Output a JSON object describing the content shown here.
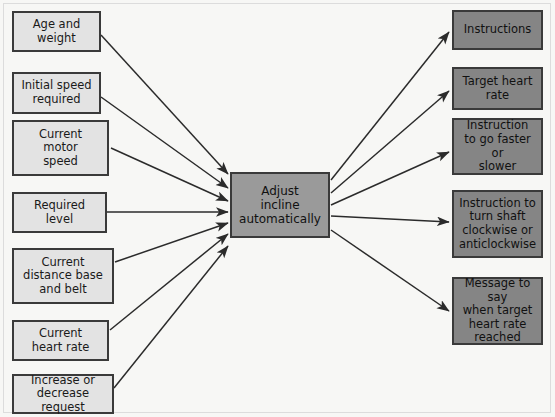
{
  "diagram": {
    "background_color": "#f7f7f5",
    "input_fill": "#e3e3e3",
    "output_fill": "#858585",
    "process_fill": "#9a9a9a",
    "border_color": "#3a3a3a",
    "arrow_color": "#2b2b2b"
  },
  "process": {
    "label": "Adjust incline automatically",
    "line1": "Adjust",
    "line2": "incline",
    "line3": "automatically"
  },
  "inputs": [
    {
      "label": "Age and weight",
      "line1": "Age and",
      "line2": "weight",
      "line3": ""
    },
    {
      "label": "Initial speed required",
      "line1": "Initial speed",
      "line2": "required",
      "line3": ""
    },
    {
      "label": "Current motor speed",
      "line1": "Current",
      "line2": "motor",
      "line3": "speed"
    },
    {
      "label": "Required level",
      "line1": "Required",
      "line2": "level",
      "line3": ""
    },
    {
      "label": "Current distance base and belt",
      "line1": "Current",
      "line2": "distance base",
      "line3": "and belt"
    },
    {
      "label": "Current heart rate",
      "line1": "Current",
      "line2": "heart rate",
      "line3": ""
    },
    {
      "label": "Increase or decrease request",
      "line1": "Increase or",
      "line2": "decrease request",
      "line3": ""
    }
  ],
  "outputs": [
    {
      "label": "Instructions",
      "line1": "Instructions",
      "line2": "",
      "line3": "",
      "line4": ""
    },
    {
      "label": "Target heart rate",
      "line1": "Target heart",
      "line2": "rate",
      "line3": "",
      "line4": ""
    },
    {
      "label": "Instruction to go faster or slower",
      "line1": "Instruction",
      "line2": "to go faster or",
      "line3": "slower",
      "line4": ""
    },
    {
      "label": "Instruction to turn shaft clockwise or anticlockwise",
      "line1": "Instruction to",
      "line2": "turn shaft",
      "line3": "clockwise or",
      "line4": "anticlockwise"
    },
    {
      "label": "Message to say when target heart rate reached",
      "line1": "Message to say",
      "line2": "when target",
      "line3": "heart rate",
      "line4": "reached"
    }
  ]
}
